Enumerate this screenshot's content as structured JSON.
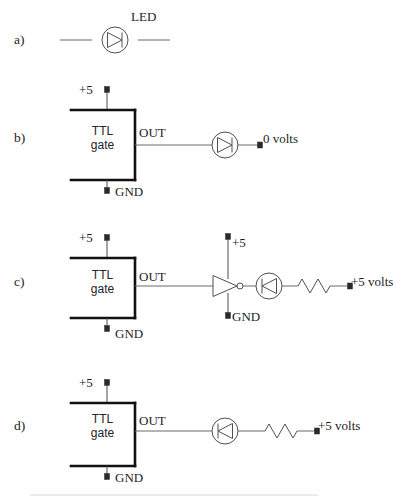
{
  "figure": {
    "background_color": "#ffffff",
    "line_color": "#666a6e",
    "box_edge_color": "#111111",
    "terminal_color": "#2a2a2a"
  },
  "sections": {
    "a": {
      "label": "a)",
      "led_label": "LED",
      "led_direction": "right",
      "description": "Standalone LED symbol on a horizontal wire"
    },
    "b": {
      "label": "b)",
      "gate_line1": "TTL",
      "gate_line2": "gate",
      "supply_label": "+5",
      "ground_label": "GND",
      "out_label": "OUT",
      "terminal_label": "0 volts",
      "led_direction": "right",
      "has_inverter": false,
      "has_resistor": false
    },
    "c": {
      "label": "c)",
      "gate_line1": "TTL",
      "gate_line2": "gate",
      "supply_label": "+5",
      "ground_label": "GND",
      "out_label": "OUT",
      "inverter_supply_label": "+5",
      "inverter_ground_label": "GND",
      "terminal_label": "+5 volts",
      "led_direction": "left",
      "has_inverter": true,
      "has_resistor": true
    },
    "d": {
      "label": "d)",
      "gate_line1": "TTL",
      "gate_line2": "gate",
      "supply_label": "+5",
      "ground_label": "GND",
      "out_label": "OUT",
      "terminal_label": "+5 volts",
      "led_direction": "left",
      "has_inverter": false,
      "has_resistor": true
    }
  }
}
